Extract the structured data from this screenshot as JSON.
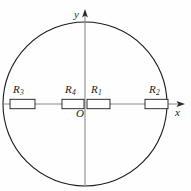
{
  "figure": {
    "background_color": "#fefefe",
    "stroke_color": "#1a1a1a",
    "axis_color": "#8a8a8a",
    "resistor_fill": "#ffffff"
  },
  "circle": {
    "center_x": 85,
    "center_y": 104,
    "radius": 82,
    "stroke_width": 1.1
  },
  "axes": {
    "x_label": "x",
    "y_label": "y",
    "origin_label": "O",
    "x_axis_y": 104,
    "y_axis_x": 85,
    "x_arrow_tip_x": 184,
    "y_arrow_tip_y": 10
  },
  "resistors": [
    {
      "id": "R3",
      "label": "R",
      "subscript": "3",
      "x": 10,
      "y": 99,
      "width": 25,
      "height": 9.5,
      "label_x": 13,
      "label_y": 84
    },
    {
      "id": "R4",
      "label": "R",
      "subscript": "4",
      "x": 62,
      "y": 99,
      "width": 22,
      "height": 9.5,
      "label_x": 65,
      "label_y": 84
    },
    {
      "id": "R1",
      "label": "R",
      "subscript": "1",
      "x": 87,
      "y": 99,
      "width": 23,
      "height": 9.5,
      "label_x": 91,
      "label_y": 84
    },
    {
      "id": "R2",
      "label": "R",
      "subscript": "2",
      "x": 145,
      "y": 99,
      "width": 23,
      "height": 9.5,
      "label_x": 149,
      "label_y": 84
    }
  ]
}
